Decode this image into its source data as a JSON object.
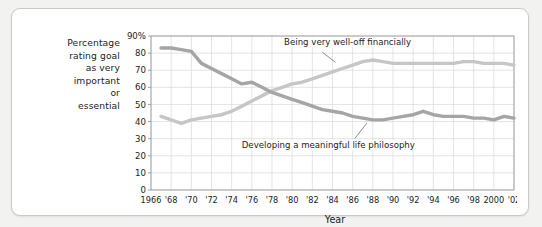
{
  "figure": {
    "y_axis_caption_lines": [
      "Percentage",
      "rating goal",
      "as very",
      "important",
      "or",
      "essential"
    ]
  },
  "chart_data": {
    "type": "line",
    "title": "",
    "xlabel": "Year",
    "ylabel": "Percentage rating goal as very important or essential",
    "xlim": [
      1966,
      2002
    ],
    "ylim": [
      0,
      90
    ],
    "grid": true,
    "legend_position": "inline-annotation",
    "y_ticks": [
      0,
      10,
      20,
      30,
      40,
      50,
      60,
      70,
      80,
      90
    ],
    "y_tick_labels": [
      "0",
      "10",
      "20",
      "30",
      "40",
      "50",
      "60",
      "70",
      "80",
      "90%"
    ],
    "x_ticks": [
      1966,
      1968,
      1970,
      1972,
      1974,
      1976,
      1978,
      1980,
      1982,
      1984,
      1986,
      1988,
      1990,
      1992,
      1994,
      1996,
      1998,
      2000,
      2002
    ],
    "x_tick_labels": [
      "1966",
      "'68",
      "'70",
      "'72",
      "'74",
      "'76",
      "'78",
      "'80",
      "'82",
      "'84",
      "'86",
      "'88",
      "'90",
      "'92",
      "'94",
      "'96",
      "'98",
      "2000",
      "'02"
    ],
    "series": [
      {
        "name": "Being very well-off financially",
        "color": "#c6c6c6",
        "annotation": "Being very well-off financially",
        "x": [
          1967,
          1968,
          1969,
          1970,
          1971,
          1972,
          1973,
          1974,
          1975,
          1976,
          1977,
          1978,
          1979,
          1980,
          1981,
          1982,
          1983,
          1984,
          1985,
          1986,
          1987,
          1988,
          1989,
          1990,
          1991,
          1992,
          1993,
          1994,
          1995,
          1996,
          1997,
          1998,
          1999,
          2000,
          2001,
          2002
        ],
        "values": [
          43,
          41,
          39,
          41,
          42,
          43,
          44,
          46,
          49,
          52,
          55,
          58,
          60,
          62,
          63,
          65,
          67,
          69,
          71,
          73,
          75,
          76,
          75,
          74,
          74,
          74,
          74,
          74,
          74,
          74,
          75,
          75,
          74,
          74,
          74,
          73
        ]
      },
      {
        "name": "Developing a meaningful life philosophy",
        "color": "#a5a5a5",
        "annotation": "Developing a meaningful life philosophy",
        "x": [
          1967,
          1968,
          1969,
          1970,
          1971,
          1972,
          1973,
          1974,
          1975,
          1976,
          1977,
          1978,
          1979,
          1980,
          1981,
          1982,
          1983,
          1984,
          1985,
          1986,
          1987,
          1988,
          1989,
          1990,
          1991,
          1992,
          1993,
          1994,
          1995,
          1996,
          1997,
          1998,
          1999,
          2000,
          2001,
          2002
        ],
        "values": [
          83,
          83,
          82,
          81,
          74,
          71,
          68,
          65,
          62,
          63,
          60,
          57,
          55,
          53,
          51,
          49,
          47,
          46,
          45,
          43,
          42,
          41,
          41,
          42,
          43,
          44,
          46,
          44,
          43,
          43,
          43,
          42,
          42,
          41,
          43,
          42
        ]
      }
    ]
  }
}
